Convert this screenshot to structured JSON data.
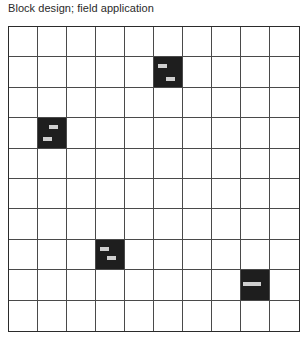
{
  "title": "Block design; field application",
  "grid": {
    "rows": 10,
    "cols": 10,
    "line_color": "#4a4a4a",
    "treated_color": "#1e1e1e",
    "marker_color": "#cfcfcf"
  },
  "treated_blocks": [
    {
      "row": 1,
      "col": 5,
      "markers": [
        {
          "x": 32,
          "y": 30
        },
        {
          "x": 60,
          "y": 72
        }
      ]
    },
    {
      "row": 3,
      "col": 1,
      "markers": [
        {
          "x": 55,
          "y": 30
        },
        {
          "x": 35,
          "y": 72
        }
      ]
    },
    {
      "row": 7,
      "col": 3,
      "markers": [
        {
          "x": 30,
          "y": 30
        },
        {
          "x": 55,
          "y": 62
        }
      ]
    },
    {
      "row": 8,
      "col": 8,
      "markers": [
        {
          "x": 22,
          "y": 46
        },
        {
          "x": 56,
          "y": 46
        }
      ]
    }
  ]
}
